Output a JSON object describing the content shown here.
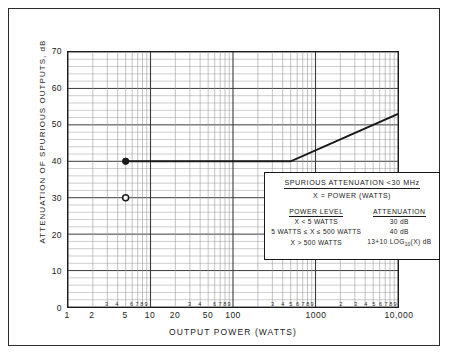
{
  "chart_data": {
    "type": "line",
    "title": "",
    "xlabel": "OUTPUT POWER (WATTS)",
    "ylabel": "ATTENUATION OF SPURIOUS OUTPUTS, dB",
    "xscale": "log",
    "xlim": [
      1,
      10000
    ],
    "ylim": [
      0,
      70
    ],
    "grid": true,
    "legend_position": "none",
    "x_major_ticks": [
      {
        "value": 1,
        "label": "1"
      },
      {
        "value": 2,
        "label": "2"
      },
      {
        "value": 5,
        "label": "5"
      },
      {
        "value": 10,
        "label": "10"
      },
      {
        "value": 20,
        "label": "20"
      },
      {
        "value": 50,
        "label": "50"
      },
      {
        "value": 100,
        "label": "100"
      },
      {
        "value": 1000,
        "label": "1000"
      },
      {
        "value": 10000,
        "label": "10,000"
      }
    ],
    "x_minor_ticks": [
      {
        "value": 3,
        "label": "3"
      },
      {
        "value": 4,
        "label": "4"
      },
      {
        "value": 6,
        "label": "6"
      },
      {
        "value": 7,
        "label": "7"
      },
      {
        "value": 8,
        "label": "8"
      },
      {
        "value": 9,
        "label": "9"
      },
      {
        "value": 30,
        "label": "3"
      },
      {
        "value": 40,
        "label": "4"
      },
      {
        "value": 60,
        "label": "6"
      },
      {
        "value": 70,
        "label": "7"
      },
      {
        "value": 80,
        "label": "8"
      },
      {
        "value": 90,
        "label": "9"
      },
      {
        "value": 300,
        "label": "3"
      },
      {
        "value": 400,
        "label": "4"
      },
      {
        "value": 500,
        "label": "5"
      },
      {
        "value": 600,
        "label": "6"
      },
      {
        "value": 700,
        "label": "7"
      },
      {
        "value": 800,
        "label": "8"
      },
      {
        "value": 900,
        "label": "9"
      },
      {
        "value": 2000,
        "label": "2"
      },
      {
        "value": 3000,
        "label": "3"
      },
      {
        "value": 4000,
        "label": "4"
      },
      {
        "value": 5000,
        "label": "5"
      },
      {
        "value": 6000,
        "label": "6"
      },
      {
        "value": 7000,
        "label": "7"
      },
      {
        "value": 8000,
        "label": "8"
      },
      {
        "value": 9000,
        "label": "9"
      }
    ],
    "y_ticks": [
      0,
      10,
      20,
      30,
      40,
      50,
      60,
      70
    ],
    "series": [
      {
        "name": "Spurious attenuation limit",
        "points": [
          {
            "x": 5,
            "y": 40
          },
          {
            "x": 500,
            "y": 40
          },
          {
            "x": 10000,
            "y": 53
          }
        ]
      }
    ],
    "markers": [
      {
        "x": 5,
        "y": 40,
        "style": "filled-circle"
      },
      {
        "x": 5,
        "y": 30,
        "style": "open-circle"
      }
    ],
    "annotation": {
      "title": "SPURIOUS  ATTENUATION  <30 MHz",
      "subtitle": "X = POWER (WATTS)",
      "columns": [
        "POWER LEVEL",
        "ATTENUATION"
      ],
      "rows": [
        {
          "level": "X < 5 WATTS",
          "attenuation": "30 dB"
        },
        {
          "level": "5 WATTS ≤ X ≤ 500 WATTS",
          "attenuation": "40 dB"
        },
        {
          "level": "X > 500 WATTS",
          "attenuation": "13+10 LOG₁₀(X) dB"
        }
      ]
    },
    "colors": {
      "line": "#1a1a1a",
      "grid_major": "#3a3a3a",
      "grid_minor": "#9a9a9a",
      "frame": "#2b2b2b"
    }
  }
}
